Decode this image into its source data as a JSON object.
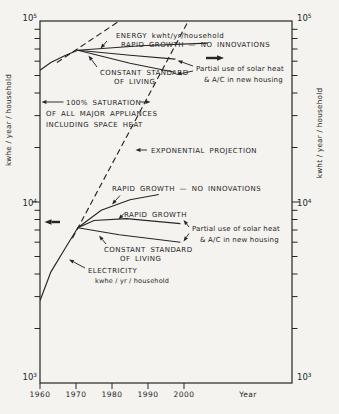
{
  "chart_data": {
    "type": "line",
    "title": "",
    "xlabel": "Year",
    "ylabel_left": "kwhe / year / household",
    "ylabel_right": "kwht / year / household",
    "grid": false,
    "legend": "none (annotated directly on curves)",
    "x_domain": [
      1960,
      2030
    ],
    "y_domain_log": [
      1000,
      100000
    ],
    "x_ticks": [
      {
        "value": 1960,
        "label": "1960"
      },
      {
        "value": 1970,
        "label": "1970"
      },
      {
        "value": 1980,
        "label": "1980"
      },
      {
        "value": 1990,
        "label": "1990"
      },
      {
        "value": 2000,
        "label": "2000"
      }
    ],
    "y_ticks": [
      {
        "value": 1000,
        "base": "10",
        "exp": "3"
      },
      {
        "value": 10000,
        "base": "10",
        "exp": "4"
      },
      {
        "value": 100000,
        "base": "10",
        "exp": "5"
      }
    ],
    "y_minor_multiples": [
      2,
      3,
      4,
      5,
      6,
      7,
      8,
      9
    ],
    "series": [
      {
        "name": "electricity-history",
        "style": "solid",
        "points": [
          [
            1960,
            2850
          ],
          [
            1963,
            4100
          ],
          [
            1967,
            5550
          ],
          [
            1970.5,
            7200
          ]
        ]
      },
      {
        "name": "electricity-exponential-projection",
        "style": "dashed",
        "points": [
          [
            1969,
            6300
          ],
          [
            2001.2,
            100000
          ]
        ]
      },
      {
        "name": "electricity-rapid-growth-no-innovations",
        "style": "solid",
        "points": [
          [
            1970.5,
            7200
          ],
          [
            1977,
            9000
          ],
          [
            1985,
            10300
          ],
          [
            1993,
            11000
          ]
        ]
      },
      {
        "name": "electricity-rapid-growth",
        "style": "solid",
        "points": [
          [
            1970.5,
            7200
          ],
          [
            1975,
            7900
          ],
          [
            1984,
            8100
          ],
          [
            1999,
            7600
          ]
        ]
      },
      {
        "name": "electricity-constant-standard-of-living",
        "style": "solid",
        "points": [
          [
            1970.5,
            7200
          ],
          [
            1982,
            6600
          ],
          [
            1999,
            6000
          ]
        ]
      },
      {
        "name": "energy-history",
        "style": "solid",
        "points": [
          [
            1960,
            53500
          ],
          [
            1963,
            59000
          ],
          [
            1967,
            64500
          ],
          [
            1970.5,
            69000
          ]
        ]
      },
      {
        "name": "energy-exponential-projection",
        "style": "dashed",
        "points": [
          [
            1964.7,
            59000
          ],
          [
            1982.7,
            102000
          ]
        ]
      },
      {
        "name": "energy-rapid-growth-no-innovations",
        "style": "solid",
        "points": [
          [
            1970.5,
            69000
          ],
          [
            1988,
            73000
          ],
          [
            2006.5,
            75500
          ]
        ]
      },
      {
        "name": "energy-rapid-growth-with-solar",
        "style": "solid",
        "points": [
          [
            1970.5,
            69000
          ],
          [
            1985,
            64700
          ],
          [
            1997.6,
            61600
          ]
        ]
      },
      {
        "name": "energy-constant-standard-of-living",
        "style": "solid",
        "points": [
          [
            1970.5,
            69000
          ],
          [
            1985,
            58400
          ],
          [
            1997.4,
            52100
          ]
        ]
      }
    ],
    "annotations": [
      {
        "text": "ENERGY kwht/yr/household",
        "x": 116,
        "y": 38,
        "case": "caps"
      },
      {
        "text": "RAPID GROWTH — NO INNOVATIONS",
        "x": 121,
        "y": 47,
        "case": "caps"
      },
      {
        "text": "CONSTANT STANDARD",
        "x": 100,
        "y": 75,
        "case": "caps"
      },
      {
        "text": "OF LIVING",
        "x": 114,
        "y": 84,
        "case": "caps"
      },
      {
        "text": "Partial use of solar heat",
        "x": 196,
        "y": 71,
        "case": "mixed"
      },
      {
        "text": "& A/C in new housing",
        "x": 204,
        "y": 82,
        "case": "mixed"
      },
      {
        "text": "100% SATURATION",
        "x": 66,
        "y": 104.5,
        "case": "caps"
      },
      {
        "text": "OF ALL MAJOR APPLIANCES",
        "x": 46,
        "y": 115.5,
        "case": "caps"
      },
      {
        "text": "INCLUDING SPACE HEAT",
        "x": 46,
        "y": 126.5,
        "case": "caps"
      },
      {
        "text": "EXPONENTIAL PROJECTION",
        "x": 151,
        "y": 152.5,
        "case": "caps"
      },
      {
        "text": "RAPID GROWTH — NO INNOVATIONS",
        "x": 112,
        "y": 191,
        "case": "caps"
      },
      {
        "text": "RAPID GROWTH",
        "x": 124,
        "y": 217,
        "case": "caps"
      },
      {
        "text": "CONSTANT STANDARD",
        "x": 104,
        "y": 252,
        "case": "caps"
      },
      {
        "text": "OF LIVING",
        "x": 120,
        "y": 261,
        "case": "caps"
      },
      {
        "text": "Partial use of solar heat",
        "x": 192,
        "y": 231,
        "case": "mixed"
      },
      {
        "text": "& A/C in new housing",
        "x": 200,
        "y": 242,
        "case": "mixed"
      },
      {
        "text": "ELECTRICITY",
        "x": 88,
        "y": 273,
        "case": "caps"
      },
      {
        "text": "kwhe / yr / household",
        "x": 95,
        "y": 283,
        "case": "mixed",
        "size": 6.5
      }
    ],
    "arrows": [
      {
        "name": "saturation-left",
        "x1": 63.5,
        "y1": 102,
        "x2": 41.5,
        "y2": 102
      },
      {
        "name": "saturation-right",
        "x1": 140,
        "y1": 102,
        "x2": 150.5,
        "y2": 102
      },
      {
        "name": "read-left-scale",
        "x1": 60,
        "y1": 222,
        "x2": 44.5,
        "y2": 222,
        "bold": true
      },
      {
        "name": "read-right-scale",
        "x1": 206,
        "y1": 58,
        "x2": 224,
        "y2": 58,
        "bold": true
      },
      {
        "name": "top-rapid-label",
        "x1": 107,
        "y1": 41,
        "x2": 100.5,
        "y2": 48.5
      },
      {
        "name": "top-constant-label",
        "x1": 97,
        "y1": 67,
        "x2": 88.5,
        "y2": 55.5
      },
      {
        "name": "top-partial-upper",
        "x1": 193,
        "y1": 66,
        "x2": 177.5,
        "y2": 60.5
      },
      {
        "name": "top-partial-lower",
        "x1": 193,
        "y1": 71,
        "x2": 176.5,
        "y2": 74.5
      },
      {
        "name": "exponential-label",
        "x1": 147,
        "y1": 150,
        "x2": 135.5,
        "y2": 150
      },
      {
        "name": "bottom-noinnov-label",
        "x1": 120,
        "y1": 195.5,
        "x2": 112,
        "y2": 204.5
      },
      {
        "name": "bottom-rapid-label",
        "x1": 124,
        "y1": 213.5,
        "x2": 118.5,
        "y2": 219.5
      },
      {
        "name": "bottom-constant-label",
        "x1": 106,
        "y1": 244,
        "x2": 99,
        "y2": 235.5
      },
      {
        "name": "bottom-partial-upper",
        "x1": 189,
        "y1": 227,
        "x2": 183.5,
        "y2": 220
      },
      {
        "name": "bottom-partial-lower",
        "x1": 189,
        "y1": 233.5,
        "x2": 183.5,
        "y2": 241.5
      },
      {
        "name": "electricity-label",
        "x1": 85,
        "y1": 268,
        "x2": 69,
        "y2": 259.5
      }
    ],
    "layout": {
      "plot": {
        "x0": 40,
        "y0": 21,
        "x1": 292,
        "y1": 383
      },
      "x_axis_title_pos": [
        248,
        397
      ],
      "x_tick_label_y": 397,
      "ylabel_left_pos": [
        11,
        120
      ],
      "ylabel_right_pos": [
        322,
        133
      ],
      "y_tick_label_baselines": {
        "3": 380,
        "4": 206,
        "5": 21
      }
    }
  }
}
